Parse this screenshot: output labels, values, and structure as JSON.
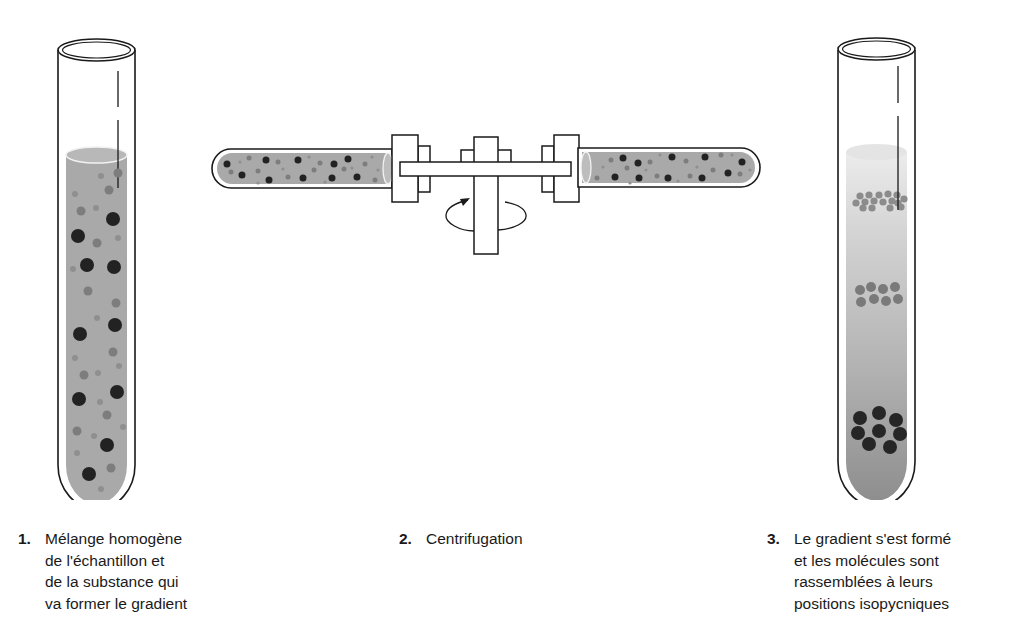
{
  "figure": {
    "type": "centrifugation-density-gradient-diagram",
    "colors": {
      "outline": "#1a1a1a",
      "liquid_homogeneous": "#a9a9a9",
      "gradient_top": "#e6e6e6",
      "gradient_bottom": "#8e8e8e",
      "particle_dark": "#222222",
      "particle_medium": "#7d7d7d",
      "particle_light": "#999999"
    },
    "steps": [
      {
        "number": "1.",
        "label": "Mélange homogène\nde l'échantillon et\nde la substance qui\nva former le gradient"
      },
      {
        "number": "2.",
        "label": "Centrifugation"
      },
      {
        "number": "3.",
        "label": "Le gradient s'est formé\net les molécules sont\nrassemblées à leurs\npositions isopycniques"
      }
    ]
  }
}
